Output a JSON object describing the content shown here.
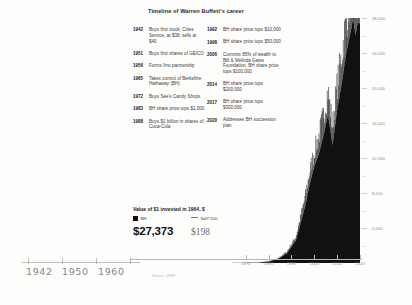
{
  "title": "Timeline of Warren Buffett's career",
  "timeline": {
    "left": [
      {
        "year": "1942",
        "text": "Buys first stock, Cities Service, at $38; sells at $40"
      },
      {
        "year": "1951",
        "text": "Buys first shares of GEICO"
      },
      {
        "year": "1956",
        "text": "Forms first partnership"
      },
      {
        "year": "1965",
        "text": "Takes control of Berkshire Hathaway (BH)"
      },
      {
        "year": "1972",
        "text": "Buys See's Candy Shops"
      },
      {
        "year": "1983",
        "text": "BH share price tops $1,000"
      },
      {
        "year": "1988",
        "text": "Buys $1 billion in shares of Coca-Cola"
      }
    ],
    "right": [
      {
        "year": "1992",
        "text": "BH share price tops $10,000"
      },
      {
        "year": "1998",
        "text": "BH share price tops $50,000"
      },
      {
        "year": "2006",
        "text": "Commits 85% of wealth to Bill & Melinda Gates Foundation. BH share price tops $100,000"
      },
      {
        "year": "2014",
        "text": "BH share price tops $200,000"
      },
      {
        "year": "2017",
        "text": "BH share price tops $300,000"
      },
      {
        "year": "2020",
        "text": "Addresses BH succession plan"
      }
    ]
  },
  "value_block": {
    "heading": "Value of $1 invested in 1964, $",
    "legend": [
      {
        "label": "BH",
        "marker": "square-swatch"
      },
      {
        "label": "S&P 500",
        "marker": "line-swatch"
      }
    ],
    "bh_value": "$27,373",
    "sp_value": "$198"
  },
  "annotations": {
    "handwritten": [
      "1942",
      "1950",
      "1960"
    ],
    "source": "Source: CRSP"
  },
  "colors": {
    "bh_series": "#111111",
    "sp_series": "#7a7a7a",
    "axis": "#b9b9b9",
    "tick_text": "#8e8e8e",
    "pencil": "#6b6b72"
  },
  "chart_data": {
    "type": "area",
    "title": "Value of $1 invested in 1964, $",
    "xlabel": "",
    "ylabel": "",
    "xlim": [
      1964,
      2020
    ],
    "ylim": [
      0,
      28000
    ],
    "grid": false,
    "legend_position": "bottom-left",
    "xticks": [
      "1970",
      "1980",
      "1990",
      "2000",
      "2010",
      "2020"
    ],
    "yticks": [
      "4,000",
      "8,000",
      "12,000",
      "16,000",
      "20,000",
      "24,000",
      "28,000"
    ],
    "series": [
      {
        "name": "BH",
        "color": "#111111",
        "x": [
          1964,
          1968,
          1972,
          1976,
          1980,
          1984,
          1988,
          1992,
          1996,
          1998,
          2000,
          2002,
          2004,
          2006,
          2008,
          2010,
          2012,
          2014,
          2016,
          2017,
          2018,
          2019,
          2020
        ],
        "values": [
          1,
          6,
          20,
          36,
          180,
          430,
          1100,
          2600,
          6500,
          9000,
          11000,
          12500,
          14500,
          17000,
          13500,
          17500,
          20500,
          24000,
          26500,
          28000,
          26000,
          27500,
          27373
        ]
      },
      {
        "name": "S&P 500",
        "color": "#7a7a7a",
        "x": [
          1964,
          1972,
          1980,
          1990,
          2000,
          2010,
          2020
        ],
        "values": [
          1,
          2,
          3,
          12,
          60,
          90,
          198
        ]
      }
    ]
  }
}
